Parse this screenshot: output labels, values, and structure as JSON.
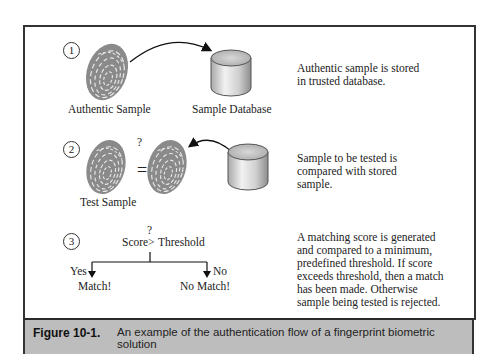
{
  "figure": {
    "label": "Figure 10-1.",
    "caption": "An example of the authentication flow of a fingerprint biometric solution"
  },
  "steps": [
    {
      "number": "1",
      "items": [
        "Authentic Sample",
        "Sample Database"
      ],
      "description_lines": [
        "Authentic sample is stored",
        "in trusted database."
      ]
    },
    {
      "number": "2",
      "items": [
        "Test Sample"
      ],
      "compare_symbol": "=",
      "question_mark": "?",
      "description_lines": [
        "Sample to be tested is",
        "compared with stored",
        "sample."
      ]
    },
    {
      "number": "3",
      "condition_left": "Score",
      "condition_op": ">",
      "condition_right": "Threshold",
      "question_mark": "?",
      "yes_label": "Yes",
      "no_label": "No",
      "yes_result": "Match!",
      "no_result": "No Match!",
      "description_lines": [
        "A matching score is generated",
        "and compared to a minimum,",
        "predefined threshold. If score",
        "exceeds threshold, then a match",
        "has been made. Otherwise",
        "sample being tested is rejected."
      ]
    }
  ],
  "icons": {
    "fingerprint": "fingerprint-icon",
    "database": "database-cylinder-icon",
    "arrow": "curved-arrow-icon"
  },
  "colors": {
    "frame_border": "#333333",
    "caption_bg": "#bdbdbd",
    "fingerprint": "#8a8a8a",
    "cylinder_light": "#eeeeee",
    "cylinder_dark": "#9a9a9a"
  }
}
